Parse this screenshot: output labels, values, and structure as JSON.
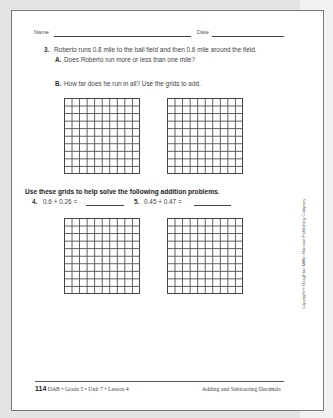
{
  "header": {
    "name_label": "Name",
    "date_label": "Date"
  },
  "problem3": {
    "number": "3.",
    "text": "Roberto runs 0.8 mile to the ball field and then 0.6 mile around the field.",
    "part_a": {
      "label": "A.",
      "text": "Does Roberto run more or less than one mile?"
    },
    "part_b": {
      "label": "B.",
      "text": "How far does he run in all? Use the grids to add."
    },
    "grids": [
      {
        "rows": 10,
        "cols": 10
      },
      {
        "rows": 10,
        "cols": 10
      }
    ]
  },
  "instructions": "Use these grids to help solve the following addition problems.",
  "problem4": {
    "number": "4.",
    "expression": "0.6 + 0.26 ="
  },
  "problem5": {
    "number": "5.",
    "expression": "0.45 + 0.47 ="
  },
  "bottom_grids": [
    {
      "rows": 10,
      "cols": 10
    },
    {
      "rows": 10,
      "cols": 10
    }
  ],
  "copyright": "Copyright © Houghton Mifflin Harcourt Publishing Company",
  "footer": {
    "page_number": "114",
    "left_text": "DAB • Grade 5 • Unit 7 • Lesson 4",
    "right_text": "Adding and Subtracting Decimals"
  }
}
